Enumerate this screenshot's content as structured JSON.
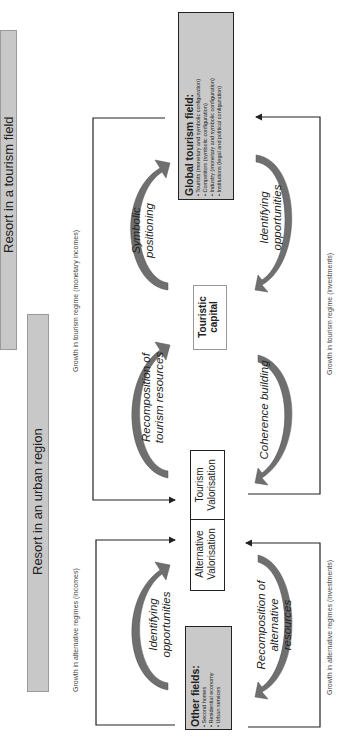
{
  "bars": {
    "tourism_field": "Resort in a tourism field",
    "urban_region": "Resort in an urban region"
  },
  "flow_labels": {
    "tourism_incomes": "Growth in tourism regime (monetary incomes)",
    "alternative_incomes": "Growth in alternative regimes (incomes)",
    "tourism_investments": "Growth in tourism regime (investments)",
    "alternative_investments": "Growth in alternative regimes (investments)"
  },
  "global_field": {
    "title": "Global tourism field:",
    "items": [
      "Tourists (monetary and symbolic configuration)",
      "Competitors (symbolic configuration)",
      "Industry (monetary and symbolic configuration)",
      "Institutions (legal and political configuration)"
    ]
  },
  "other_fields": {
    "title": "Other fields:",
    "items": [
      "Second homes",
      "Residential economy",
      "Urban services"
    ]
  },
  "center": {
    "touristic_capital": [
      "Touristic",
      "capital"
    ],
    "alternative_valorisation": [
      "Alternative",
      "Valorisation"
    ],
    "tourism_valorisation": [
      "Tourism",
      "Valorisation"
    ]
  },
  "processes": {
    "symbolic_positioning": [
      "Symbolic",
      "positioning"
    ],
    "identifying_opportunities_tourism": [
      "Identifying",
      "opportunities"
    ],
    "recomposition_tourism": [
      "Recomposition of",
      "tourism resources"
    ],
    "coherence_building": [
      "Coherence building"
    ],
    "identifying_opportunities_alt": [
      "Identifying",
      "opportunities"
    ],
    "recomposition_alternative": [
      "Recomposition of",
      "alternative",
      "resources"
    ]
  },
  "colors": {
    "bar_gray": "#c8c8c8",
    "box_gray": "#c9c9c9",
    "arc_gray": "#6f6f6f",
    "line": "#222222"
  }
}
